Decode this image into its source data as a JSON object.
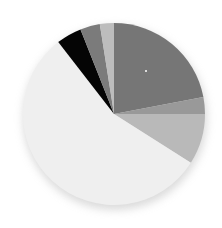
{
  "chart_data": {
    "type": "pie",
    "title": "",
    "legend": [],
    "start_angle_deg": 0,
    "direction": "clockwise",
    "slices": [
      {
        "label": "",
        "value": 22.0,
        "color": "#767676"
      },
      {
        "label": "",
        "value": 3.0,
        "color": "#999999"
      },
      {
        "label": "",
        "value": 9.0,
        "color": "#b9b9b9"
      },
      {
        "label": "",
        "value": 55.5,
        "color": "#efefef"
      },
      {
        "label": "",
        "value": 4.5,
        "color": "#050505"
      },
      {
        "label": "",
        "value": 3.5,
        "color": "#7b7b7b"
      },
      {
        "label": "",
        "value": 2.5,
        "color": "#bdbdbd"
      }
    ],
    "center": [
      114,
      114
    ],
    "radius": 91
  }
}
